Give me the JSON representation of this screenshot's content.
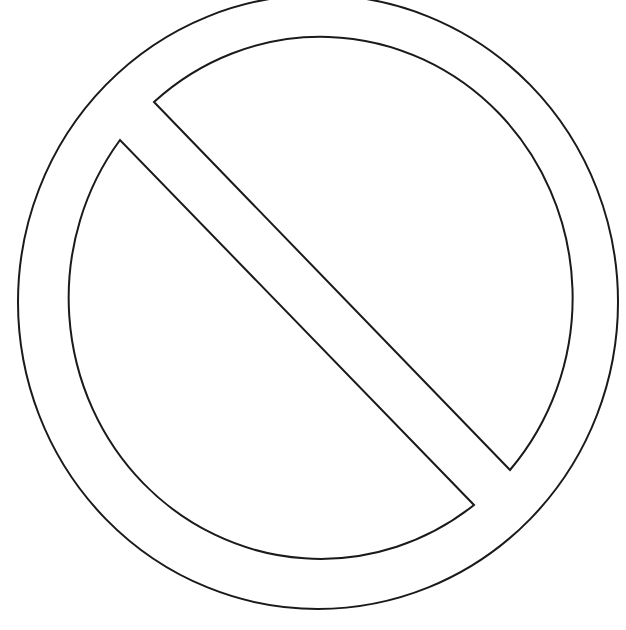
{
  "image": {
    "subject": "prohibition-sign-outline",
    "background": "#ffffff",
    "stroke_color": "#1a1a1a",
    "stroke_width": 2,
    "outer_ring": {
      "cx": 318,
      "cy": 302,
      "rx": 300,
      "ry": 307
    },
    "inner_ring": {
      "cx": 318,
      "cy": 302,
      "rx": 252,
      "ry": 261
    },
    "slash": {
      "upper_region_vertices": [
        [
          154,
          102
        ],
        [
          510,
          470
        ]
      ],
      "lower_region_vertices": [
        [
          120,
          140
        ],
        [
          474,
          505
        ]
      ]
    }
  }
}
